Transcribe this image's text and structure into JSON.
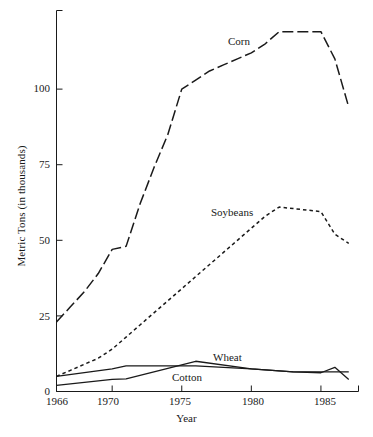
{
  "chart_data": {
    "type": "line",
    "title": "",
    "xlabel": "Year",
    "ylabel": "Metric Tons (in thousands)",
    "xlim": [
      1966,
      1987.7
    ],
    "ylim": [
      0,
      126
    ],
    "xticks": [
      1966,
      1970,
      1975,
      1980,
      1985
    ],
    "xtick_labels": [
      "1966",
      "1970",
      "1975",
      "1980",
      "1985"
    ],
    "yticks": [
      0,
      25,
      50,
      75,
      100
    ],
    "ytick_labels": [
      "0",
      "25",
      "50",
      "75",
      "100"
    ],
    "grid": false,
    "legend": "inline-annotations",
    "series": [
      {
        "name": "Corn",
        "style": "long-dash",
        "label_x": 1978.0,
        "label_y": 117,
        "x": [
          1966,
          1967,
          1968,
          1969,
          1970,
          1971,
          1972,
          1973,
          1974,
          1975,
          1976,
          1977,
          1978,
          1979,
          1980,
          1981,
          1982,
          1983,
          1984,
          1985,
          1986,
          1987
        ],
        "y": [
          23,
          28,
          33,
          39,
          47,
          48,
          62,
          74,
          85,
          100,
          103,
          106,
          108,
          110,
          112,
          115,
          119,
          119,
          119,
          119,
          110,
          94
        ]
      },
      {
        "name": "Soybeans",
        "style": "short-dash",
        "label_x": 1976.4,
        "label_y": 58,
        "x": [
          1966,
          1967,
          1968,
          1969,
          1970,
          1971,
          1972,
          1973,
          1974,
          1975,
          1976,
          1977,
          1978,
          1979,
          1980,
          1981,
          1982,
          1983,
          1984,
          1985,
          1986,
          1987
        ],
        "y": [
          5,
          7,
          9,
          11,
          14,
          18,
          22,
          26,
          30,
          34,
          38,
          42,
          46,
          50,
          54,
          58,
          61,
          60.5,
          60,
          59.5,
          52,
          49
        ]
      },
      {
        "name": "Wheat",
        "style": "solid",
        "label_x": 1980.0,
        "label_y": 11,
        "x": [
          1966,
          1970,
          1971,
          1976,
          1980,
          1983,
          1985,
          1986,
          1987
        ],
        "y": [
          5,
          7.5,
          8.5,
          8.5,
          7.5,
          6.5,
          6.5,
          6.5,
          6.5
        ]
      },
      {
        "name": "Cotton",
        "style": "solid",
        "label_x": 1976.1,
        "label_y": 5,
        "x": [
          1966,
          1970,
          1971,
          1976,
          1980,
          1983,
          1985,
          1986,
          1987
        ],
        "y": [
          2,
          4,
          4.2,
          10,
          7.5,
          6.5,
          6.2,
          8,
          4
        ]
      }
    ]
  },
  "axis": {
    "ylabel": "Metric Tons (in thousands)",
    "xlabel": "Year",
    "ytick_labels": [
      "100",
      "75",
      "50",
      "25",
      "0"
    ],
    "xtick_labels": [
      "1966",
      "1970",
      "1975",
      "1980",
      "1985"
    ]
  },
  "annotations": {
    "corn": "Corn",
    "soybeans": "Soybeans",
    "wheat": "Wheat",
    "cotton": "Cotton"
  },
  "caption": ""
}
